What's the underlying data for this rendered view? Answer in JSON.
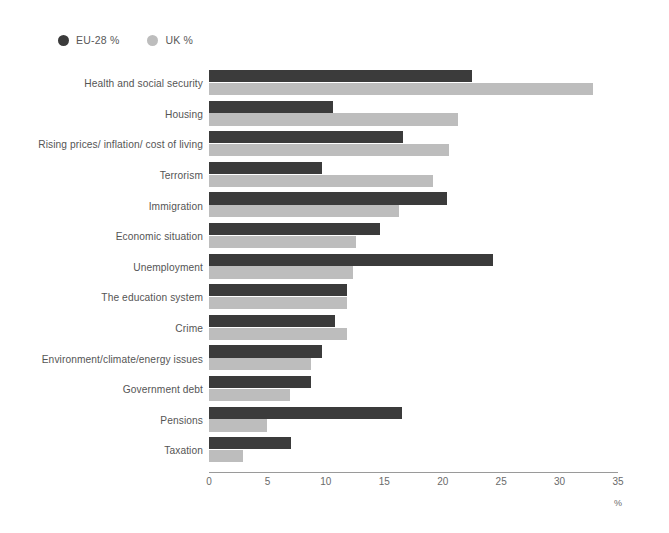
{
  "legend": {
    "position": "top-left",
    "items": [
      {
        "label": "EU-28 %",
        "color": "#3b3b3b",
        "key": "eu"
      },
      {
        "label": "UK %",
        "color": "#bdbdbd",
        "key": "uk"
      }
    ]
  },
  "axis": {
    "unit_label": "%",
    "ticks": [
      "0",
      "5",
      "10",
      "15",
      "20",
      "25",
      "30",
      "35"
    ]
  },
  "chart_data": {
    "type": "bar",
    "orientation": "horizontal",
    "grouped": true,
    "title": "",
    "subtitle": "",
    "xlabel": "%",
    "ylabel": "",
    "xlim": [
      0,
      35
    ],
    "xticks": [
      0,
      5,
      10,
      15,
      20,
      25,
      30,
      35
    ],
    "grid": false,
    "legend_position": "top-left",
    "categories": [
      "Health and social security",
      "Housing",
      "Rising prices/ inflation/ cost of living",
      "Terrorism",
      "Immigration",
      "Economic situation",
      "Unemployment",
      "The education system",
      "Crime",
      "Environment/climate/energy issues",
      "Government debt",
      "Pensions",
      "Taxation"
    ],
    "series": [
      {
        "name": "EU-28 %",
        "color": "#3b3b3b",
        "values": [
          22.5,
          10.6,
          16.6,
          9.7,
          20.4,
          14.6,
          24.3,
          11.8,
          10.8,
          9.7,
          8.7,
          16.5,
          7.0
        ]
      },
      {
        "name": "UK %",
        "color": "#bdbdbd",
        "values": [
          32.9,
          21.3,
          20.5,
          19.2,
          16.3,
          12.6,
          12.3,
          11.8,
          11.8,
          8.7,
          6.9,
          5.0,
          2.9
        ]
      }
    ]
  }
}
